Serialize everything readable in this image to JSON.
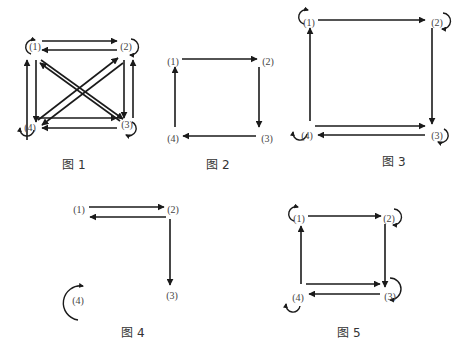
{
  "colors": {
    "stroke": "#1a1a1a",
    "label": "#444444",
    "background": "#ffffff"
  },
  "figures": [
    {
      "id": "fig1",
      "caption": "图 1",
      "caption_pos": [
        74,
        169
      ],
      "nodes": [
        {
          "id": "1",
          "label": "(1)",
          "x": 35,
          "y": 47
        },
        {
          "id": "2",
          "label": "(2)",
          "x": 126,
          "y": 47
        },
        {
          "id": "3",
          "label": "(3)",
          "x": 127,
          "y": 125
        },
        {
          "id": "4",
          "label": "(4)",
          "x": 30,
          "y": 128
        }
      ],
      "edges": [
        {
          "from": [
            42,
            41
          ],
          "to": [
            117,
            41
          ]
        },
        {
          "from": [
            117,
            50
          ],
          "to": [
            42,
            50
          ]
        },
        {
          "from": [
            27,
            140
          ],
          "to": [
            27,
            60
          ]
        },
        {
          "from": [
            36,
            60
          ],
          "to": [
            36,
            122
          ]
        },
        {
          "from": [
            124,
            60
          ],
          "to": [
            124,
            118
          ]
        },
        {
          "from": [
            133,
            118
          ],
          "to": [
            133,
            60
          ]
        },
        {
          "from": [
            38,
            118
          ],
          "to": [
            117,
            118
          ]
        },
        {
          "from": [
            117,
            128
          ],
          "to": [
            42,
            128
          ]
        },
        {
          "from": [
            38,
            120
          ],
          "to": [
            118,
            58
          ]
        },
        {
          "from": [
            123,
            63
          ],
          "to": [
            42,
            125
          ]
        },
        {
          "from": [
            41,
            60
          ],
          "to": [
            123,
            119
          ]
        },
        {
          "from": [
            120,
            121
          ],
          "to": [
            40,
            63
          ]
        }
      ],
      "loops": [
        {
          "node": "1",
          "cx": 27,
          "cy": 45,
          "side": "left-top"
        },
        {
          "node": "2",
          "cx": 134,
          "cy": 48,
          "side": "right"
        },
        {
          "node": "3",
          "cx": 134,
          "cy": 130,
          "side": "right-bottom"
        },
        {
          "node": "4",
          "cx": 25,
          "cy": 134,
          "side": "left-bottom"
        }
      ]
    },
    {
      "id": "fig2",
      "caption": "图 2",
      "caption_pos": [
        218,
        169
      ],
      "nodes": [
        {
          "id": "1",
          "label": "(1)",
          "x": 173,
          "y": 62
        },
        {
          "id": "2",
          "label": "(2)",
          "x": 268,
          "y": 62
        },
        {
          "id": "3",
          "label": "(3)",
          "x": 267,
          "y": 139
        },
        {
          "id": "4",
          "label": "(4)",
          "x": 173,
          "y": 139
        }
      ],
      "edges": [
        {
          "from": [
            182,
            59
          ],
          "to": [
            257,
            59
          ]
        },
        {
          "from": [
            259,
            67
          ],
          "to": [
            259,
            127
          ]
        },
        {
          "from": [
            256,
            136
          ],
          "to": [
            183,
            136
          ]
        },
        {
          "from": [
            175,
            127
          ],
          "to": [
            175,
            67
          ]
        }
      ],
      "loops": []
    },
    {
      "id": "fig3",
      "caption": "图 3",
      "caption_pos": [
        394,
        166
      ],
      "nodes": [
        {
          "id": "1",
          "label": "(1)",
          "x": 309,
          "y": 23
        },
        {
          "id": "2",
          "label": "(2)",
          "x": 437,
          "y": 23
        },
        {
          "id": "3",
          "label": "(3)",
          "x": 437,
          "y": 136
        },
        {
          "id": "4",
          "label": "(4)",
          "x": 307,
          "y": 136
        }
      ],
      "edges": [
        {
          "from": [
            318,
            20
          ],
          "to": [
            425,
            20
          ]
        },
        {
          "from": [
            432,
            28
          ],
          "to": [
            432,
            124
          ]
        },
        {
          "from": [
            315,
            126
          ],
          "to": [
            425,
            126
          ]
        },
        {
          "from": [
            425,
            135
          ],
          "to": [
            318,
            135
          ]
        },
        {
          "from": [
            310,
            121
          ],
          "to": [
            310,
            28
          ]
        }
      ],
      "loops": [
        {
          "node": "1",
          "cx": 300,
          "cy": 15,
          "side": "left-top"
        },
        {
          "node": "2",
          "cx": 446,
          "cy": 22,
          "side": "right"
        },
        {
          "node": "3",
          "cx": 446,
          "cy": 137,
          "side": "right-bottom"
        },
        {
          "node": "4",
          "cx": 298,
          "cy": 138,
          "side": "left-bottom"
        }
      ]
    },
    {
      "id": "fig4",
      "caption": "图 4",
      "caption_pos": [
        133,
        337
      ],
      "nodes": [
        {
          "id": "1",
          "label": "(1)",
          "x": 79,
          "y": 210
        },
        {
          "id": "2",
          "label": "(2)",
          "x": 173,
          "y": 210
        },
        {
          "id": "3",
          "label": "(3)",
          "x": 172,
          "y": 296
        },
        {
          "id": "4",
          "label": "(4)",
          "x": 78,
          "y": 301
        }
      ],
      "edges": [
        {
          "from": [
            89,
            207
          ],
          "to": [
            164,
            207
          ]
        },
        {
          "from": [
            166,
            217
          ],
          "to": [
            90,
            217
          ]
        },
        {
          "from": [
            170,
            219
          ],
          "to": [
            170,
            285
          ]
        }
      ],
      "loops": [
        {
          "node": "4",
          "cx": 74,
          "cy": 298,
          "side": "left-open"
        }
      ]
    },
    {
      "id": "fig5",
      "caption": "图 5",
      "caption_pos": [
        349,
        337
      ],
      "nodes": [
        {
          "id": "1",
          "label": "(1)",
          "x": 299,
          "y": 219
        },
        {
          "id": "2",
          "label": "(2)",
          "x": 389,
          "y": 219
        },
        {
          "id": "3",
          "label": "(3)",
          "x": 390,
          "y": 297
        },
        {
          "id": "4",
          "label": "(4)",
          "x": 298,
          "y": 298
        }
      ],
      "edges": [
        {
          "from": [
            308,
            216
          ],
          "to": [
            381,
            216
          ]
        },
        {
          "from": [
            385,
            224
          ],
          "to": [
            385,
            287
          ]
        },
        {
          "from": [
            306,
            284
          ],
          "to": [
            380,
            284
          ]
        },
        {
          "from": [
            380,
            294
          ],
          "to": [
            309,
            294
          ]
        },
        {
          "from": [
            301,
            284
          ],
          "to": [
            301,
            226
          ]
        }
      ],
      "loops": [
        {
          "node": "1",
          "cx": 290,
          "cy": 212,
          "side": "left-top"
        },
        {
          "node": "2",
          "cx": 397,
          "cy": 218,
          "side": "right"
        },
        {
          "node": "3",
          "cx": 398,
          "cy": 294,
          "side": "right-big"
        },
        {
          "node": "4",
          "cx": 291,
          "cy": 310,
          "side": "left-bottom"
        }
      ]
    }
  ]
}
